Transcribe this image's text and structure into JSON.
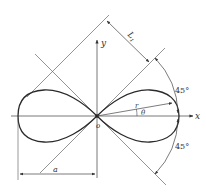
{
  "diagram": {
    "colors": {
      "curve": "#2a2a2a",
      "lines": "#555555",
      "text": "#333333",
      "background": "#ffffff"
    },
    "labels": {
      "x_axis": "x",
      "y_axis": "y",
      "origin": "o",
      "radius": "r",
      "angle": "θ",
      "dimension_a": "a",
      "dimension_L": "L",
      "dimension_L_sub": "1",
      "angle_upper": "45°",
      "angle_lower": "45°"
    }
  }
}
